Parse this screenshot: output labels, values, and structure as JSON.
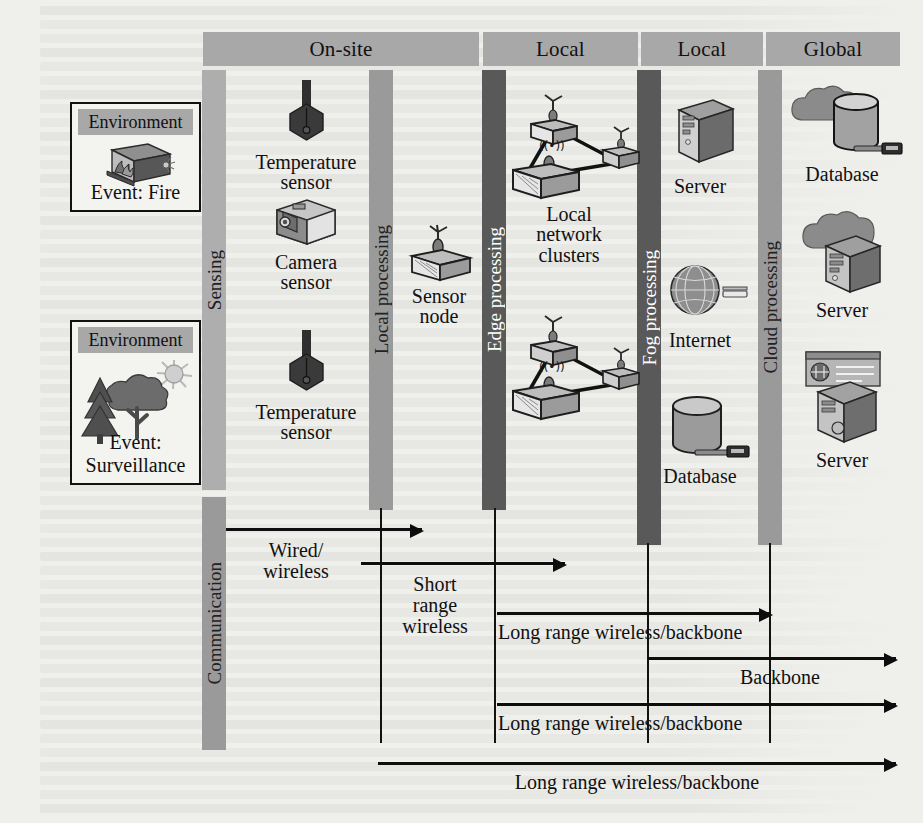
{
  "tiers": [
    {
      "id": "on-site",
      "label": "On-site"
    },
    {
      "id": "local-edge",
      "label": "Local"
    },
    {
      "id": "local-fog",
      "label": "Local"
    },
    {
      "id": "global",
      "label": "Global"
    }
  ],
  "bands": [
    {
      "id": "sensing",
      "label": "Sensing",
      "shade": "light"
    },
    {
      "id": "local-processing",
      "label": "Local processing",
      "shade": "mid"
    },
    {
      "id": "edge-processing",
      "label": "Edge processing",
      "shade": "dark"
    },
    {
      "id": "fog-processing",
      "label": "Fog processing",
      "shade": "dark"
    },
    {
      "id": "cloud-processing",
      "label": "Cloud processing",
      "shade": "mid"
    },
    {
      "id": "communication",
      "label": "Communication",
      "shade": "mid"
    }
  ],
  "environments": [
    {
      "id": "fire",
      "header": "Environment",
      "caption": "Event: Fire",
      "icon": "fire-building-icon"
    },
    {
      "id": "surveillance",
      "header": "Environment",
      "caption": "Event: Surveillance",
      "icon": "forest-sun-icon"
    }
  ],
  "nodes": [
    {
      "id": "temperature-sensor-1",
      "caption": "Temperature\nsensor",
      "icon": "thermometer-icon"
    },
    {
      "id": "camera-sensor",
      "caption": "Camera\nsensor",
      "icon": "camera-icon"
    },
    {
      "id": "temperature-sensor-2",
      "caption": "Temperature\nsensor",
      "icon": "thermometer-icon"
    },
    {
      "id": "sensor-node",
      "caption": "Sensor\nnode",
      "icon": "sensor-node-icon"
    },
    {
      "id": "local-network-clusters",
      "caption": "Local\nnetwork\nclusters",
      "icon": "network-cluster-icon"
    },
    {
      "id": "fog-server",
      "caption": "Server",
      "icon": "server-tower-icon"
    },
    {
      "id": "internet",
      "caption": "Internet",
      "icon": "globe-grid-icon"
    },
    {
      "id": "fog-database",
      "caption": "Database",
      "icon": "database-cylinder-icon"
    },
    {
      "id": "cloud-database",
      "caption": "Database",
      "icon": "cloud-database-icon"
    },
    {
      "id": "cloud-server-1",
      "caption": "Server",
      "icon": "cloud-server-icon"
    },
    {
      "id": "cloud-server-2",
      "caption": "Server",
      "icon": "monitor-server-icon"
    }
  ],
  "communication_links": [
    {
      "id": "link-wired-wireless",
      "label": "Wired/\nwireless",
      "from": "sensing",
      "to": "local-processing"
    },
    {
      "id": "link-short-range",
      "label": "Short\nrange\nwireless",
      "from": "local-processing",
      "to": "edge-processing"
    },
    {
      "id": "link-long-range-1",
      "label": "Long range wireless/backbone",
      "from": "edge-processing",
      "to": "fog-processing"
    },
    {
      "id": "link-backbone",
      "label": "Backbone",
      "from": "fog-processing",
      "to": "cloud-processing"
    },
    {
      "id": "link-long-range-2",
      "label": "Long range wireless/backbone",
      "from": "edge-processing",
      "to": "cloud-processing"
    },
    {
      "id": "link-long-range-3",
      "label": "Long range wireless/backbone",
      "from": "local-processing",
      "to": "cloud-processing"
    }
  ],
  "colors": {
    "header_bar": "#a8a8a8",
    "band_light": "#aeaeae",
    "band_mid": "#9a9a9a",
    "band_dark": "#595959",
    "page": "#efefec",
    "ink": "#111111"
  }
}
